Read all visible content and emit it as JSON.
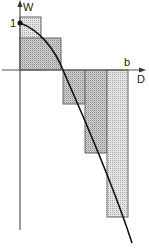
{
  "diagram": {
    "y_axis_label": "W",
    "x_axis_label": "D",
    "y_tick_label": "1",
    "x_tick_label": "b",
    "colors": {
      "axis": "#555555",
      "curve": "#111111",
      "rect_stroke": "#666666",
      "rect_fill_light": "#e4e4e4",
      "rect_fill_dark": "#cfcfcf"
    },
    "rectangles": [
      {
        "x": 20,
        "y": 17,
        "w": 21,
        "h": 53,
        "shade": "light"
      },
      {
        "x": 20,
        "y": 38,
        "w": 41,
        "h": 32,
        "shade": "dark"
      },
      {
        "x": 63,
        "y": 70,
        "w": 22,
        "h": 34,
        "shade": "dark"
      },
      {
        "x": 85,
        "y": 70,
        "w": 22,
        "h": 83,
        "shade": "dark"
      },
      {
        "x": 107,
        "y": 70,
        "w": 21,
        "h": 147,
        "shade": "light"
      }
    ]
  }
}
